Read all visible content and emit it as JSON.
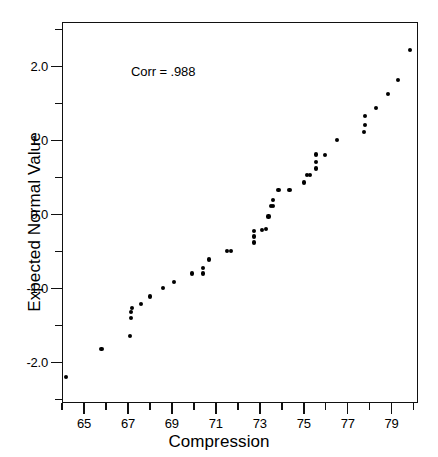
{
  "chart_data": {
    "type": "scatter",
    "title": "",
    "xlabel": "Compression",
    "ylabel": "Expected Normal Value",
    "annotation": "Corr = .988",
    "grid": false,
    "legend": null,
    "xlim": [
      64.0,
      80.2
    ],
    "ylim": [
      -2.55,
      2.6
    ],
    "x_major_ticks": [
      65,
      67,
      69,
      71,
      73,
      75,
      77,
      79
    ],
    "x_minor_ticks": [
      64,
      66,
      68,
      70,
      72,
      74,
      76,
      78,
      80
    ],
    "x_tick_labels": [
      "65",
      "67",
      "69",
      "71",
      "73",
      "75",
      "77",
      "79"
    ],
    "y_major_ticks": [
      2.0,
      1.0,
      0.0,
      -1.0,
      -2.0
    ],
    "y_minor_ticks": [
      2.5,
      1.5,
      0.5,
      -0.5,
      -1.5,
      -2.5
    ],
    "y_tick_labels": [
      "2.0",
      "1.0",
      "0.0",
      "-1.0",
      "-2.0"
    ],
    "marker": "filled-circle",
    "marker_color": "#000000",
    "n_points": 44,
    "points": [
      {
        "x": 64.2,
        "y": -2.2
      },
      {
        "x": 65.8,
        "y": -1.82
      },
      {
        "x": 67.1,
        "y": -1.64
      },
      {
        "x": 67.15,
        "y": -1.4
      },
      {
        "x": 67.15,
        "y": -1.32
      },
      {
        "x": 67.2,
        "y": -1.27
      },
      {
        "x": 67.6,
        "y": -1.21
      },
      {
        "x": 68.0,
        "y": -1.11
      },
      {
        "x": 68.6,
        "y": -1.0
      },
      {
        "x": 69.1,
        "y": -0.91
      },
      {
        "x": 69.9,
        "y": -0.8
      },
      {
        "x": 70.4,
        "y": -0.8
      },
      {
        "x": 70.4,
        "y": -0.73
      },
      {
        "x": 70.7,
        "y": -0.61
      },
      {
        "x": 71.5,
        "y": -0.49
      },
      {
        "x": 71.7,
        "y": -0.49
      },
      {
        "x": 72.75,
        "y": -0.38
      },
      {
        "x": 72.75,
        "y": -0.3
      },
      {
        "x": 72.75,
        "y": -0.23
      },
      {
        "x": 73.1,
        "y": -0.21
      },
      {
        "x": 73.3,
        "y": -0.2
      },
      {
        "x": 73.4,
        "y": -0.03
      },
      {
        "x": 73.5,
        "y": 0.11
      },
      {
        "x": 73.6,
        "y": 0.11
      },
      {
        "x": 73.6,
        "y": 0.19
      },
      {
        "x": 73.85,
        "y": 0.33
      },
      {
        "x": 74.35,
        "y": 0.33
      },
      {
        "x": 75.0,
        "y": 0.43
      },
      {
        "x": 75.15,
        "y": 0.53
      },
      {
        "x": 75.3,
        "y": 0.53
      },
      {
        "x": 75.55,
        "y": 0.62
      },
      {
        "x": 75.55,
        "y": 0.71
      },
      {
        "x": 75.55,
        "y": 0.81
      },
      {
        "x": 75.95,
        "y": 0.8
      },
      {
        "x": 76.5,
        "y": 1.01
      },
      {
        "x": 77.75,
        "y": 1.11
      },
      {
        "x": 77.8,
        "y": 1.21
      },
      {
        "x": 77.8,
        "y": 1.33
      },
      {
        "x": 78.3,
        "y": 1.44
      },
      {
        "x": 78.85,
        "y": 1.63
      },
      {
        "x": 79.3,
        "y": 1.82
      },
      {
        "x": 79.85,
        "y": 2.22
      }
    ]
  }
}
